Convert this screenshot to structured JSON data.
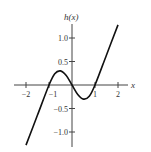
{
  "chart_data": {
    "type": "line",
    "title": "",
    "xlabel": "x",
    "ylabel": "h(x)",
    "xlim": [
      -2.3,
      2.4
    ],
    "ylim": [
      -1.3,
      1.3
    ],
    "x_ticks": [
      -2,
      -1,
      1,
      2
    ],
    "x_tick_labels": [
      "-2",
      "-1",
      "1",
      "2"
    ],
    "y_ticks": [
      1.0,
      0.5,
      -0.5,
      -1.0
    ],
    "y_tick_labels": [
      "1.0",
      "0.5",
      "-0.5",
      "-1.0"
    ],
    "grid": false,
    "series": [
      {
        "name": "h(x)",
        "x": [
          -2.0,
          -1.5,
          -1.0,
          -0.75,
          -0.5,
          -0.25,
          0.0,
          0.25,
          0.5,
          0.75,
          1.0,
          1.5,
          2.0
        ],
        "values": [
          -1.28,
          -0.64,
          0.0,
          0.24,
          0.3,
          0.2,
          0.0,
          -0.2,
          -0.3,
          -0.24,
          0.0,
          0.64,
          1.28
        ]
      }
    ]
  }
}
